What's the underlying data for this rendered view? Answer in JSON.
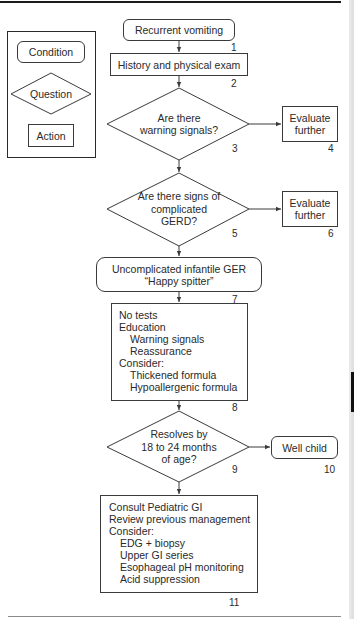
{
  "legend": {
    "condition": "Condition",
    "question": "Question",
    "action": "Action"
  },
  "nodes": {
    "n1": {
      "text": "Recurrent vomiting",
      "number": "1",
      "type": "condition"
    },
    "n2": {
      "text": "History and physical exam",
      "number": "2",
      "type": "action"
    },
    "n3": {
      "lines": [
        "Are there",
        "warning signals?"
      ],
      "number": "3",
      "type": "question"
    },
    "n4": {
      "lines": [
        "Evaluate",
        "further"
      ],
      "number": "4",
      "type": "action"
    },
    "n5": {
      "lines": [
        "Are there signs of",
        "complicated",
        "GERD?"
      ],
      "number": "5",
      "type": "question"
    },
    "n6": {
      "lines": [
        "Evaluate",
        "further"
      ],
      "number": "6",
      "type": "action"
    },
    "n7": {
      "lines": [
        "Uncomplicated infantile GER",
        "“Happy spitter”"
      ],
      "number": "7",
      "type": "condition"
    },
    "n8": {
      "lines": [
        {
          "text": "No tests",
          "indent": false
        },
        {
          "text": "Education",
          "indent": false
        },
        {
          "text": "Warning signals",
          "indent": true
        },
        {
          "text": "Reassurance",
          "indent": true
        },
        {
          "text": "Consider:",
          "indent": false
        },
        {
          "text": "Thickened formula",
          "indent": true
        },
        {
          "text": "Hypoallergenic formula",
          "indent": true
        }
      ],
      "number": "8",
      "type": "action"
    },
    "n9": {
      "lines": [
        "Resolves by",
        "18 to 24 months",
        "of age?"
      ],
      "number": "9",
      "type": "question"
    },
    "n10": {
      "text": "Well child",
      "number": "10",
      "type": "condition"
    },
    "n11": {
      "lines": [
        {
          "text": "Consult Pediatric GI",
          "indent": false
        },
        {
          "text": "Review previous management",
          "indent": false
        },
        {
          "text": "Consider:",
          "indent": false
        },
        {
          "text": "EDG + biopsy",
          "indent": true
        },
        {
          "text": "Upper GI series",
          "indent": true
        },
        {
          "text": "Esophageal pH monitoring",
          "indent": true
        },
        {
          "text": "Acid suppression",
          "indent": true
        }
      ],
      "number": "11",
      "type": "action"
    }
  },
  "colors": {
    "line": "#3a3a3a",
    "background": "#ffffff",
    "edge_tab": "#111111"
  }
}
